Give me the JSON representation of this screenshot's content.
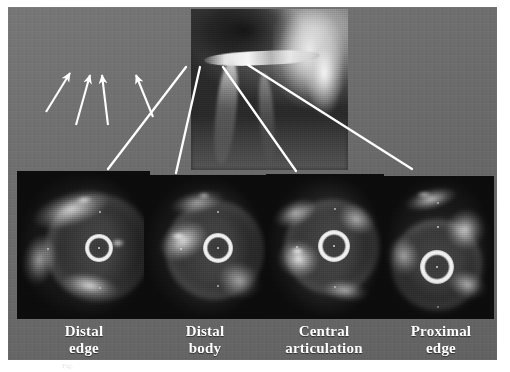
{
  "figure": {
    "kind": "medical-imaging-figure",
    "modality_top": "coronary angiogram",
    "modality_bottom": "intravascular ultrasound (IVUS) cross-sections",
    "background_color": "#6f6f6f",
    "label_color": "#ffffff",
    "annotation_color": "#ffffff",
    "caption_remnant": "Fig."
  },
  "angiogram": {
    "name": "coronary-angiogram",
    "arrow_count": 4,
    "arrows": [
      {
        "id": "arrow-distal-edge",
        "label": "distal edge"
      },
      {
        "id": "arrow-distal-body",
        "label": "distal body"
      },
      {
        "id": "arrow-central-articulation",
        "label": "central articulation"
      },
      {
        "id": "arrow-proximal-edge",
        "label": "proximal edge"
      }
    ]
  },
  "panels": [
    {
      "id": "distal-edge",
      "label": "Distal\nedge",
      "label_line1": "Distal",
      "label_line2": "edge"
    },
    {
      "id": "distal-body",
      "label": "Distal\nbody",
      "label_line1": "Distal",
      "label_line2": "body"
    },
    {
      "id": "central-articulation",
      "label": "Central\narticulation",
      "label_line1": "Central",
      "label_line2": "articulation"
    },
    {
      "id": "proximal-edge",
      "label": "Proximal\nedge",
      "label_line1": "Proximal",
      "label_line2": "edge"
    }
  ]
}
